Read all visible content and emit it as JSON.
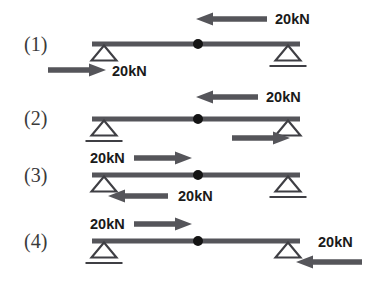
{
  "figure": {
    "background_color": "#ffffff",
    "beam_color": "#55555a",
    "arrow_color": "#55555a",
    "support_color": "#3f3f44",
    "hinge_color": "#141414",
    "label_color": "#3a3a3a",
    "text_color": "#1a1a1a"
  },
  "cases": [
    {
      "id": "case-1",
      "label": "(1)",
      "beam": {
        "x1": 92,
        "x2": 300,
        "y": 44
      },
      "hinge": {
        "x": 198,
        "y": 44
      },
      "supports": [
        {
          "name": "left-support-pin",
          "type": "pin",
          "x": 104,
          "y": 44
        },
        {
          "name": "right-support-roller",
          "type": "roller",
          "x": 288,
          "y": 44
        }
      ],
      "forces": [
        {
          "name": "upper-right-force",
          "value": "20kN",
          "direction": "left",
          "tip_x": 196,
          "tail_x": 267,
          "y": 19,
          "label_x": 275,
          "label_y": 24
        },
        {
          "name": "lower-left-force",
          "value": "20kN",
          "direction": "right",
          "tip_x": 106,
          "tail_x": 48,
          "y": 70,
          "label_x": 112,
          "label_y": 76
        }
      ]
    },
    {
      "id": "case-2",
      "label": "(2)",
      "beam": {
        "x1": 92,
        "x2": 300,
        "y": 119
      },
      "hinge": {
        "x": 198,
        "y": 119
      },
      "supports": [
        {
          "name": "left-support-roller",
          "type": "roller",
          "x": 104,
          "y": 119
        },
        {
          "name": "right-support-pin",
          "type": "pin",
          "x": 288,
          "y": 119
        }
      ],
      "forces": [
        {
          "name": "upper-right-force",
          "value": "20kN",
          "direction": "left",
          "tip_x": 196,
          "tail_x": 258,
          "y": 97,
          "label_x": 266,
          "label_y": 102
        },
        {
          "name": "lower-right-force",
          "value": "",
          "direction": "right",
          "tip_x": 290,
          "tail_x": 232,
          "y": 138,
          "label_x": 0,
          "label_y": 0
        }
      ]
    },
    {
      "id": "case-3",
      "label": "(3)",
      "beam": {
        "x1": 92,
        "x2": 300,
        "y": 175
      },
      "hinge": {
        "x": 198,
        "y": 175
      },
      "supports": [
        {
          "name": "left-support-pin",
          "type": "pin",
          "x": 104,
          "y": 175
        },
        {
          "name": "right-support-roller",
          "type": "roller",
          "x": 288,
          "y": 175
        }
      ],
      "forces": [
        {
          "name": "upper-left-force",
          "value": "20kN",
          "direction": "right",
          "tip_x": 192,
          "tail_x": 134,
          "y": 158,
          "label_x": 90,
          "label_y": 163
        },
        {
          "name": "lower-left-force",
          "value": "20kN",
          "direction": "left",
          "tip_x": 108,
          "tail_x": 168,
          "y": 196,
          "label_x": 178,
          "label_y": 201
        }
      ]
    },
    {
      "id": "case-4",
      "label": "(4)",
      "beam": {
        "x1": 92,
        "x2": 300,
        "y": 241
      },
      "hinge": {
        "x": 198,
        "y": 241
      },
      "supports": [
        {
          "name": "left-support-roller",
          "type": "roller",
          "x": 104,
          "y": 241
        },
        {
          "name": "right-support-pin",
          "type": "pin",
          "x": 288,
          "y": 241
        }
      ],
      "forces": [
        {
          "name": "upper-left-force",
          "value": "20kN",
          "direction": "right",
          "tip_x": 192,
          "tail_x": 134,
          "y": 224,
          "label_x": 90,
          "label_y": 229
        },
        {
          "name": "lower-right-force",
          "value": "20kN",
          "direction": "left",
          "tip_x": 296,
          "tail_x": 362,
          "y": 262,
          "label_x": 318,
          "label_y": 247
        }
      ]
    }
  ],
  "case_label_positions": [
    {
      "x": 24,
      "y": 51
    },
    {
      "x": 24,
      "y": 125
    },
    {
      "x": 24,
      "y": 182
    },
    {
      "x": 24,
      "y": 248
    }
  ]
}
